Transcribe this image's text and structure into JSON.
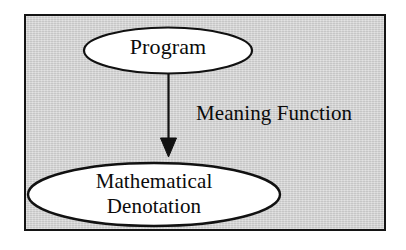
{
  "diagram": {
    "panel": {
      "fill_color": "#d2d2d2",
      "border_color": "#141414"
    },
    "nodes": [
      {
        "id": "program",
        "shape": "ellipse",
        "label": "Program",
        "fill_color": "#ffffff",
        "stroke_color": "#111111"
      },
      {
        "id": "mathematical-denotation",
        "shape": "ellipse",
        "label_line_1": "Mathematical",
        "label_line_2": "Denotation",
        "fill_color": "#ffffff",
        "stroke_color": "#111111"
      }
    ],
    "edges": [
      {
        "id": "meaning-function",
        "label": "Meaning Function",
        "from": "program",
        "to": "mathematical-denotation",
        "direction": "down",
        "arrowhead": "filled-triangle",
        "stroke_color": "#111111"
      }
    ]
  }
}
